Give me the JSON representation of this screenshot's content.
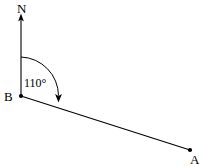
{
  "diagram": {
    "type": "bearing-diagram",
    "background_color": "#ffffff",
    "stroke_color": "#000000",
    "north_label": "N",
    "point_b_label": "B",
    "point_a_label": "A",
    "angle_label": "110°",
    "angle_value": 110,
    "angle_unit": "degrees",
    "points": {
      "B": {
        "x": 21,
        "y": 96
      },
      "A": {
        "x": 190,
        "y": 150
      },
      "north_arrow_tip": {
        "x": 21,
        "y": 14
      }
    },
    "arc": {
      "start": {
        "x": 21,
        "y": 57
      },
      "end": {
        "x": 58,
        "y": 100
      },
      "radius": 39,
      "direction": "clockwise",
      "arrowhead": "end"
    }
  }
}
